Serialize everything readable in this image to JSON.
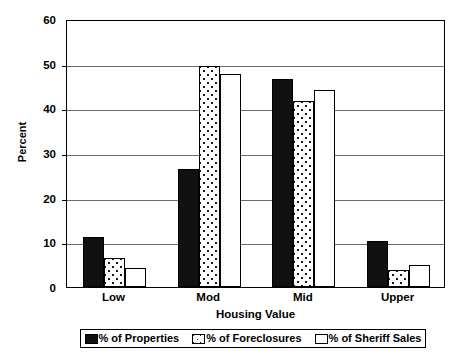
{
  "chart_data": {
    "type": "bar",
    "title": "",
    "xlabel": "Housing Value",
    "ylabel": "Percent",
    "categories": [
      "Low",
      "Mod",
      "Mid",
      "Upper"
    ],
    "series": [
      {
        "name": "% of Properties",
        "pattern": "solid-black",
        "values": [
          11.2,
          26.5,
          46.5,
          10.3
        ]
      },
      {
        "name": "% of Foreclosures",
        "pattern": "dotted",
        "values": [
          6.4,
          49.4,
          41.7,
          3.7
        ]
      },
      {
        "name": "% of Sheriff Sales",
        "pattern": "white",
        "values": [
          4.3,
          47.8,
          44.0,
          5.0
        ]
      }
    ],
    "ylim": [
      0,
      60
    ],
    "yticks": [
      0,
      10,
      20,
      30,
      40,
      50,
      60
    ],
    "ytick_labels": [
      "0",
      "10",
      "20",
      "30",
      "40",
      "50",
      "60"
    ],
    "grid": true,
    "legend_position": "bottom",
    "colors": {
      "axis": "#000000",
      "grid": "#6d6d6d",
      "series_0": "#111111",
      "series_1": "#ffffff",
      "series_2": "#ffffff",
      "background": "#ffffff"
    }
  }
}
